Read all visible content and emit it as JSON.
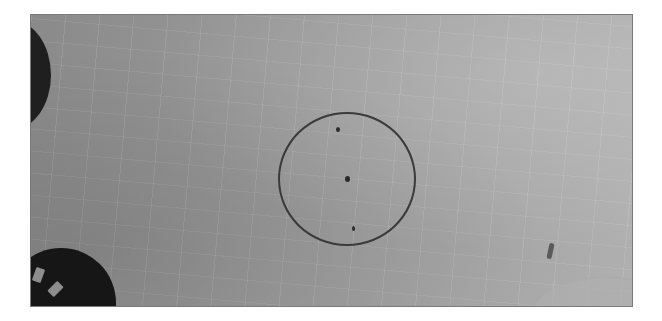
{
  "image": {
    "description": "Grayscale photograph of a tiled/textured light-gray surface with a thin dark circle drawn in the center containing three small dots, partial dark dials at the left edges, and a pale rounded object at the bottom-right corner",
    "colors": {
      "surface": "#9c9c9c",
      "circle_stroke": "#3a3a3a",
      "dial": "#1a1a1a",
      "border": "#7a7a7a"
    }
  }
}
